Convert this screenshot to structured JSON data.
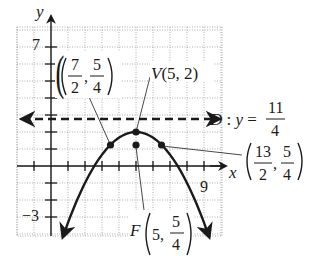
{
  "chart_data": {
    "type": "line",
    "title": "",
    "xlabel": "x",
    "ylabel": "y",
    "xlim": [
      -2,
      10
    ],
    "ylim": [
      -4,
      8
    ],
    "grid": true,
    "x_tick_labels": [
      {
        "value": 9,
        "label": "9"
      }
    ],
    "y_tick_labels": [
      {
        "value": 7,
        "label": "7"
      },
      {
        "value": -3,
        "label": "−3"
      }
    ],
    "curve": {
      "name": "parabola",
      "equation": "y = 2 - (x - 5)^2 / 3",
      "x_range": [
        0.7,
        9.3
      ],
      "arrows_at_ends": true
    },
    "directrix": {
      "name": "D",
      "equation": "y = 11/4",
      "value": 2.75,
      "style": "dashed",
      "arrows_both_ends": true
    },
    "points": [
      {
        "name": "V",
        "x": 5,
        "y": 2,
        "label": "V(5, 2)"
      },
      {
        "name": "F",
        "x": 5,
        "y": 1.25,
        "label": "F(5, 5/4)"
      },
      {
        "name": "",
        "x": 3.5,
        "y": 1.25,
        "label": "(7/2, 5/4)"
      },
      {
        "name": "",
        "x": 6.5,
        "y": 1.25,
        "label": "(13/2, 5/4)"
      }
    ]
  },
  "labels": {
    "x_axis": "x",
    "y_axis": "y",
    "tick_7": "7",
    "tick_neg3": "−3",
    "tick_9": "9",
    "vertex": "V(5, 2)",
    "directrix_prefix": "D : y =",
    "directrix_num": "11",
    "directrix_den": "4",
    "left_point_x_num": "7",
    "left_point_x_den": "2",
    "left_point_y_num": "5",
    "left_point_y_den": "4",
    "right_point_x_num": "13",
    "right_point_x_den": "2",
    "right_point_y_num": "5",
    "right_point_y_den": "4",
    "focus_name": "F",
    "focus_x": "5,",
    "focus_y_num": "5",
    "focus_y_den": "4",
    "comma": ","
  }
}
